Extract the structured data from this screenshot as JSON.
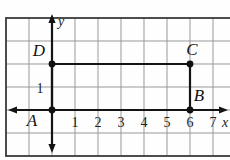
{
  "figure": {
    "type": "coordinate-plane-geometry",
    "shape": {
      "kind": "rectangle",
      "vertex_order": "ABCD"
    },
    "axis_labels": {
      "x": "x",
      "y": "y"
    },
    "points": [
      {
        "label": "A",
        "x": 0,
        "y": 0,
        "label_pos": "below-left"
      },
      {
        "label": "B",
        "x": 6,
        "y": 0,
        "label_pos": "above-right"
      },
      {
        "label": "C",
        "x": 6,
        "y": 2,
        "label_pos": "above"
      },
      {
        "label": "D",
        "x": 0,
        "y": 2,
        "label_pos": "above-left"
      }
    ],
    "x_ticks": [
      {
        "label": "1",
        "x": 1
      },
      {
        "label": "2",
        "x": 2
      },
      {
        "label": "3",
        "x": 3
      },
      {
        "label": "4",
        "x": 4
      },
      {
        "label": "5",
        "x": 5
      },
      {
        "label": "6",
        "x": 6
      },
      {
        "label": "7",
        "x": 7
      }
    ],
    "y_ticks": [
      {
        "label": "1",
        "y": 1
      }
    ],
    "colors": {
      "background": "#fefefe",
      "grid_line": "#999999",
      "frame": "#3a3a3a",
      "axis": "#141414",
      "shape_line": "#141414",
      "point_dot": "#111111",
      "text": "#111111"
    }
  }
}
